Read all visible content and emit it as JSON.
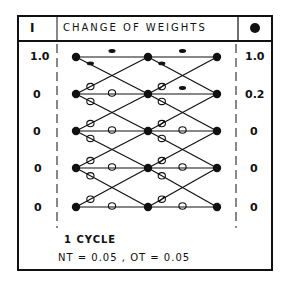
{
  "header": {
    "input_label": "I",
    "title": "CHANGE OF WEIGHTS",
    "output_label": "O"
  },
  "inputs": [
    "1.0",
    "0",
    "0",
    "0",
    "0"
  ],
  "outputs": [
    "1.0",
    "0.2",
    "0",
    "0",
    "0"
  ],
  "network": {
    "columns": 3,
    "rows": 5,
    "weight_marks": {
      "legend": {
        "dash": "−",
        "circle": "o",
        "slashed": "ø"
      }
    }
  },
  "footer": {
    "cycle_label": "1 CYCLE",
    "params": "NT = 0.05 ,   OT = 0.05"
  }
}
